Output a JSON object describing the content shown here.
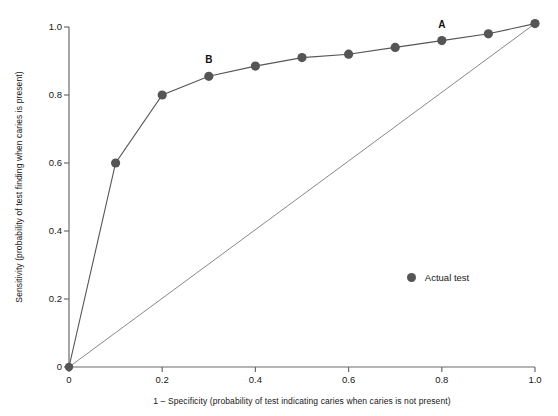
{
  "chart_data": {
    "type": "line",
    "title": "",
    "xlabel": "1 – Specificity (probability of test indicating caries when caries is not present)",
    "ylabel": "Sensitivity (probability of test finding when caries is present)",
    "xlim": [
      0,
      1.0
    ],
    "ylim": [
      0,
      1.0
    ],
    "grid": false,
    "legend_position": "inside-right",
    "xticks": [
      {
        "value": 0,
        "label": "0"
      },
      {
        "value": 0.2,
        "label": "0.2"
      },
      {
        "value": 0.4,
        "label": "0.4"
      },
      {
        "value": 0.6,
        "label": "0.6"
      },
      {
        "value": 0.8,
        "label": "0.8"
      },
      {
        "value": 1.0,
        "label": "1.0"
      }
    ],
    "yticks": [
      {
        "value": 0,
        "label": "0"
      },
      {
        "value": 0.2,
        "label": "0.2"
      },
      {
        "value": 0.4,
        "label": "0.4"
      },
      {
        "value": 0.6,
        "label": "0.6"
      },
      {
        "value": 0.8,
        "label": "0.8"
      },
      {
        "value": 1.0,
        "label": "1.0"
      }
    ],
    "series": [
      {
        "name": "Actual test",
        "color": "#555555",
        "marker": "circle",
        "x": [
          0,
          0.1,
          0.2,
          0.3,
          0.4,
          0.5,
          0.6,
          0.7,
          0.8,
          0.9,
          1.0
        ],
        "values": [
          0,
          0.6,
          0.8,
          0.855,
          0.885,
          0.91,
          0.92,
          0.94,
          0.96,
          0.98,
          1.01
        ]
      },
      {
        "name": "Reference diagonal",
        "color": "#7a7a7a",
        "marker": "none",
        "x": [
          0,
          1.0
        ],
        "values": [
          0,
          1.01
        ]
      }
    ],
    "annotations": [
      {
        "label": "A",
        "x": 0.8,
        "y": 0.96
      },
      {
        "label": "B",
        "x": 0.3,
        "y": 0.855
      }
    ]
  },
  "legend": {
    "entries": [
      {
        "label": "Actual test",
        "color": "#555555"
      }
    ]
  }
}
